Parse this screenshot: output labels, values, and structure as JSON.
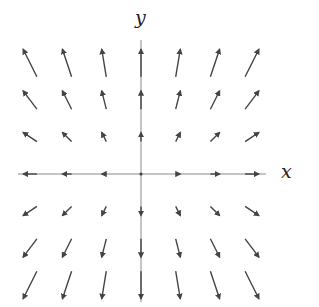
{
  "diagram": {
    "type": "vector-field",
    "axes": {
      "x_label": "x",
      "y_label": "y",
      "color": "#8a8a8a"
    },
    "arrow_color": "#444444",
    "grid": {
      "x_values": [
        -3,
        -2,
        -1,
        0,
        1,
        2,
        3
      ],
      "y_values": [
        -3,
        -2,
        -1,
        0,
        1,
        2,
        3
      ]
    },
    "field": {
      "fx_coeff": 1,
      "fy_coeff": 2
    }
  }
}
